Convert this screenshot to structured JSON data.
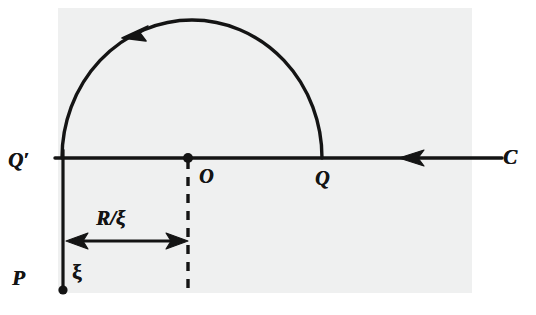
{
  "figure": {
    "background_color": "#eceded",
    "ink_color": "#141414"
  },
  "labels": {
    "q_prime": "Q′",
    "origin": "O",
    "q": "Q",
    "contour": "C",
    "p": "P",
    "xi": "ξ",
    "radius_over_xi": "R/ξ"
  },
  "elements": {
    "semicircle_arc": "semicircular-arc",
    "arc_direction_arrow": "counterclockwise-arrow",
    "real_axis_line": "horizontal-axis-line",
    "axis_direction_arrow": "leftward-arrow",
    "vertical_segment": "vertical-line-Qprime-to-P",
    "dashed_vertical": "dashed-vertical-line-from-origin",
    "dimension_arrow": "double-headed-dimension-arrow",
    "origin_dot": "origin-point-marker",
    "p_dot": "point-P-marker"
  },
  "geometry": {
    "arc_left_x": 62,
    "arc_right_x": 322,
    "arc_apex_y": 20,
    "baseline_y": 158,
    "origin_x": 188,
    "axis_right_x": 502,
    "p_y": 290,
    "dimension_y": 241
  }
}
